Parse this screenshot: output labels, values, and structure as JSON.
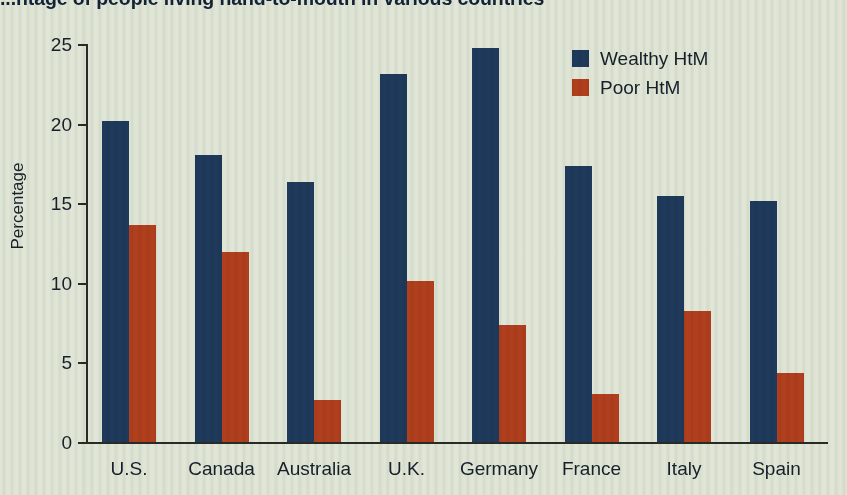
{
  "chart_data": {
    "type": "bar",
    "title": "...ntage of people living hand-to-mouth in various countries",
    "xlabel": "",
    "ylabel": "Percentage",
    "categories": [
      "U.S.",
      "Canada",
      "Australia",
      "U.K.",
      "Germany",
      "France",
      "Italy",
      "Spain"
    ],
    "series": [
      {
        "name": "Wealthy HtM",
        "color": "#1f3a5e",
        "values": [
          20.2,
          18.1,
          16.4,
          23.2,
          24.8,
          17.4,
          15.5,
          15.2
        ]
      },
      {
        "name": "Poor HtM",
        "color": "#b5401e",
        "values": [
          13.7,
          12.0,
          2.7,
          10.2,
          7.4,
          3.1,
          8.3,
          4.4
        ]
      }
    ],
    "ylim": [
      0,
      25
    ],
    "yticks": [
      0,
      5,
      10,
      15,
      20,
      25
    ],
    "ytick_labels": [
      "0",
      "5",
      "10",
      "15",
      "20",
      "25"
    ],
    "grid": false,
    "legend_position": "top-right",
    "background_color": "#e6eade",
    "axis_color": "#2b2b28"
  }
}
